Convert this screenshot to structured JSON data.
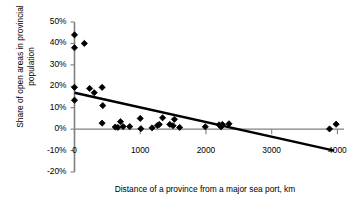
{
  "chart_data": {
    "type": "scatter",
    "title": "",
    "xlabel": "Distance of a province from a major sea port, km",
    "ylabel": "Share of open areas in provincial population",
    "xlim": [
      0,
      4100
    ],
    "ylim": [
      -20,
      50
    ],
    "xticks": [
      0,
      1000,
      2000,
      3000,
      4000
    ],
    "xticklabels": [
      "0",
      "1000",
      "2000",
      "3000",
      "4000"
    ],
    "yticks": [
      -20,
      -10,
      0,
      10,
      20,
      30,
      40,
      50
    ],
    "yticklabels": [
      "-20%",
      "-10%",
      "0%",
      "10%",
      "20%",
      "30%",
      "40%",
      "50%"
    ],
    "grid": false,
    "legend": null,
    "marker": "diamond",
    "marker_color": "#000000",
    "line_color": "#000000",
    "axis_color": "#808080",
    "series": [
      {
        "name": "Provinces",
        "points": [
          [
            0,
            44
          ],
          [
            0,
            38
          ],
          [
            0,
            19.5
          ],
          [
            0,
            13.5
          ],
          [
            150,
            40
          ],
          [
            230,
            19
          ],
          [
            300,
            17
          ],
          [
            420,
            19.5
          ],
          [
            430,
            11
          ],
          [
            420,
            2.8
          ],
          [
            620,
            1
          ],
          [
            660,
            0.8
          ],
          [
            700,
            3.5
          ],
          [
            740,
            1.2
          ],
          [
            840,
            1.2
          ],
          [
            1000,
            5
          ],
          [
            1010,
            0.2
          ],
          [
            1180,
            0.6
          ],
          [
            1260,
            1.7
          ],
          [
            1290,
            2.2
          ],
          [
            1340,
            5.3
          ],
          [
            1450,
            2.2
          ],
          [
            1500,
            1.6
          ],
          [
            1520,
            4.6
          ],
          [
            1600,
            0.8
          ],
          [
            1990,
            1.1
          ],
          [
            2200,
            2
          ],
          [
            2230,
            1.1
          ],
          [
            2250,
            2.2
          ],
          [
            2350,
            2.5
          ],
          [
            3880,
            0.1
          ],
          [
            3980,
            2.3
          ]
        ]
      }
    ],
    "trendline": {
      "type": "linear",
      "from": [
        0,
        17
      ],
      "to": [
        3950,
        -10
      ]
    }
  },
  "axis_titles": {
    "x": "Distance of a province from a major sea port, km",
    "y": "Share of open areas in provincial population"
  }
}
